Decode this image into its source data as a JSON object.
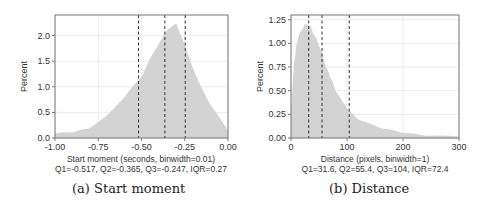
{
  "chart_data": [
    {
      "type": "bar",
      "panel": "a",
      "caption": "(a) Start moment",
      "ylabel": "Percent",
      "xlabel": "Start moment (seconds, binwidth=0.01)",
      "stats": "Q1=-0.517, Q2=-0.365, Q3=-0.247, IQR=0.27",
      "xlim": [
        -1.0,
        0.0
      ],
      "ylim": [
        0,
        2.4
      ],
      "xticks": [
        -1.0,
        -0.75,
        -0.5,
        -0.25,
        0.0
      ],
      "xtick_labels": [
        "-1.00",
        "-0.75",
        "-0.50",
        "-0.25",
        "0.00"
      ],
      "yticks": [
        0.0,
        0.5,
        1.0,
        1.5,
        2.0
      ],
      "ytick_labels": [
        "0.0",
        "0.5",
        "1.0",
        "1.5",
        "2.0"
      ],
      "grid": true,
      "quartile_lines": [
        -0.517,
        -0.365,
        -0.247
      ],
      "binwidth": 0.01,
      "x": [
        -1.0,
        -0.95,
        -0.9,
        -0.85,
        -0.8,
        -0.75,
        -0.7,
        -0.65,
        -0.6,
        -0.55,
        -0.5,
        -0.45,
        -0.4,
        -0.35,
        -0.3,
        -0.25,
        -0.2,
        -0.15,
        -0.1,
        -0.05,
        0.0
      ],
      "values": [
        0.1,
        0.1,
        0.12,
        0.15,
        0.2,
        0.3,
        0.45,
        0.6,
        0.8,
        1.0,
        1.2,
        1.55,
        1.85,
        2.1,
        2.25,
        1.8,
        1.35,
        0.95,
        0.65,
        0.4,
        0.15
      ]
    },
    {
      "type": "bar",
      "panel": "b",
      "caption": "(b) Distance",
      "ylabel": "Percent",
      "xlabel": "Distance (pixels, binwidth=1)",
      "stats": "Q1=31.6, Q2=55.4, Q3=104, IQR=72.4",
      "xlim": [
        0,
        300
      ],
      "ylim": [
        0,
        1.3
      ],
      "xticks": [
        0,
        100,
        200,
        300
      ],
      "xtick_labels": [
        "0",
        "100",
        "200",
        "300"
      ],
      "yticks": [
        0.0,
        0.25,
        0.5,
        0.75,
        1.0,
        1.25
      ],
      "ytick_labels": [
        "0.00",
        "0.25",
        "0.50",
        "0.75",
        "1.00",
        "1.25"
      ],
      "grid": true,
      "quartile_lines": [
        31.6,
        55.4,
        104
      ],
      "binwidth": 1,
      "x": [
        0,
        5,
        10,
        15,
        20,
        25,
        30,
        35,
        40,
        45,
        50,
        55,
        60,
        65,
        70,
        75,
        80,
        90,
        100,
        110,
        120,
        140,
        160,
        180,
        200,
        220,
        240,
        260,
        280,
        300
      ],
      "values": [
        0.3,
        0.75,
        1.0,
        1.1,
        1.15,
        1.2,
        1.2,
        1.18,
        1.1,
        1.05,
        0.98,
        0.9,
        0.8,
        0.72,
        0.65,
        0.58,
        0.5,
        0.4,
        0.32,
        0.25,
        0.2,
        0.15,
        0.11,
        0.08,
        0.06,
        0.04,
        0.03,
        0.02,
        0.03,
        0.01
      ]
    }
  ],
  "layout_panels": [
    {
      "left": 55,
      "right": 228,
      "top": 15,
      "bottom": 138,
      "caption_x": 72,
      "caption_y": 188,
      "label_cx": 141
    },
    {
      "left": 291,
      "right": 459,
      "top": 15,
      "bottom": 138,
      "caption_x": 330,
      "caption_y": 188,
      "label_cx": 375
    }
  ],
  "colors": {
    "bars": "#d3d3d3",
    "grid": "#ececec",
    "frame": "#777777",
    "quartile": "#333333",
    "text": "#333333"
  }
}
